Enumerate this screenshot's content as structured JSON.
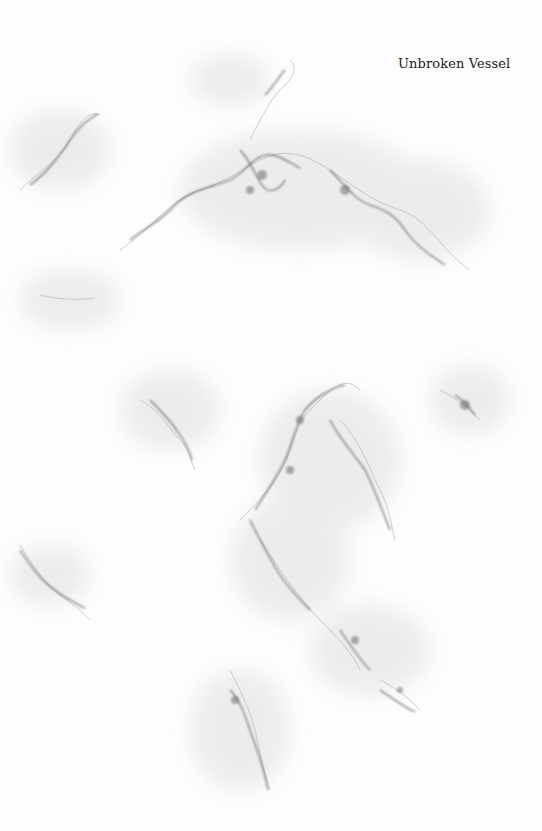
{
  "title": "Unbroken Vessel",
  "colors": {
    "background": "#fdfdfd",
    "vein": "#555555",
    "haze": "#d8d8d8"
  }
}
